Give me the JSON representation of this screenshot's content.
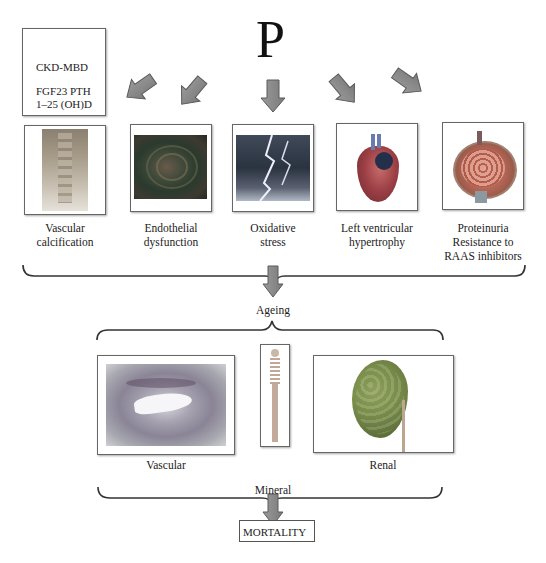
{
  "title_symbol": "P",
  "ckd_box": {
    "title": "CKD-MBD",
    "line1": "FGF23 PTH",
    "line2": "1–25 (OH)D"
  },
  "row1": [
    {
      "id": "vascular-calcification",
      "label_line1": "Vascular",
      "label_line2": "calcification",
      "image": "spine-xray-image"
    },
    {
      "id": "endothelial-dysfunction",
      "label_line1": "Endothelial",
      "label_line2": "dysfunction",
      "image": "endothelium-image"
    },
    {
      "id": "oxidative-stress",
      "label_line1": "Oxidative",
      "label_line2": "stress",
      "image": "lightning-image"
    },
    {
      "id": "left-ventricular-hypertrophy",
      "label_line1": "Left ventricular",
      "label_line2": "hypertrophy",
      "image": "heart-image"
    },
    {
      "id": "proteinuria",
      "label_line1": "Proteinuria",
      "label_line2": "Resistance to",
      "label_line3": "RAAS inhibitors",
      "image": "glomerulus-image"
    }
  ],
  "ageing_label": "Ageing",
  "row2": [
    {
      "id": "vascular",
      "label": "Vascular",
      "image": "artery-histology-image"
    },
    {
      "id": "mineral",
      "label": "Mineral",
      "image": "skeleton-image"
    },
    {
      "id": "renal",
      "label": "Renal",
      "image": "kidney-image"
    }
  ],
  "outcome": "MORTALITY",
  "colors": {
    "arrow_fill": "#8a8a8a",
    "arrow_stroke": "#5a5a5a",
    "frame_border": "#666666",
    "brace": "#333333"
  }
}
